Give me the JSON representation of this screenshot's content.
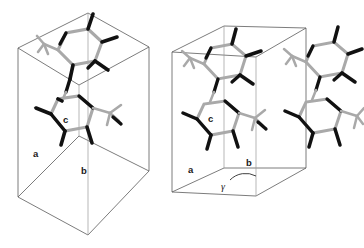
{
  "figure": {
    "background_color": "#ffffff",
    "cell_edge_color": "#5a5a5a",
    "bond_dark_color": "#111111",
    "bond_light_color": "#a8a8a8",
    "hydrogen_color": "#c9c9c9"
  },
  "panels": [
    {
      "id": "left",
      "name": "unit-cell-view-left",
      "description": "Tall parallelepiped unit cell viewed with c axis vertical, containing two stacked aromatic molecules",
      "molecule_count": 2,
      "labels": {
        "a": "a",
        "b": "b",
        "c": "c"
      }
    },
    {
      "id": "right",
      "name": "unit-cell-view-right",
      "description": "Wider box unit cell viewed down c axis showing gamma angle, containing two molecular columns",
      "molecule_count": 4,
      "labels": {
        "a": "a",
        "b": "b",
        "c": "c",
        "gamma": "γ"
      }
    }
  ]
}
